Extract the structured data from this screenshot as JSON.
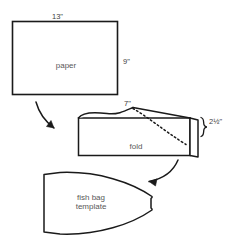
{
  "diagram": {
    "type": "craft-instruction-diagram",
    "ink_color": "#1a1a1a",
    "text_color": "#4a4a4a",
    "background": "#ffffff",
    "steps": [
      {
        "name": "paper-rectangle",
        "label": "paper",
        "dimensions": {
          "width": "13\"",
          "height": "9\""
        }
      },
      {
        "name": "folded-paper",
        "label": "fold",
        "dimensions": {
          "top": "7\"",
          "right": "2½\""
        }
      },
      {
        "name": "fish-bag-template",
        "label_line1": "fish bag",
        "label_line2": "template"
      }
    ]
  },
  "labels": {
    "width_13": "13\"",
    "height_9": "9\"",
    "top_7": "7\"",
    "right_two_and_half": "2½\"",
    "paper": "paper",
    "fold": "fold",
    "fish_bag_line1": "fish bag",
    "fish_bag_line2": "template"
  },
  "icons": {
    "arrow_one": "curved-arrow-down-right-icon",
    "arrow_two": "curved-arrow-down-left-icon",
    "brace": "curly-brace-icon",
    "dashed_cut_line": "dashed-cut-line-icon"
  }
}
